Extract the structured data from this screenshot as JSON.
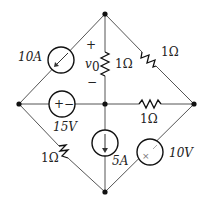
{
  "diagram": {
    "type": "circuit",
    "nodes": [
      "top",
      "left",
      "center",
      "right",
      "bottom"
    ],
    "labels": {
      "current_source_top_left": "10A",
      "v0_label": "v",
      "v0_sub": "0",
      "v0_plus": "+",
      "v0_minus": "−",
      "resistor_center_top": "1Ω",
      "resistor_top_right": "1Ω",
      "resistor_center_right": "1Ω",
      "voltage_source_left": "15V",
      "resistor_left_bottom": "1Ω",
      "current_source_center_bottom": "5A",
      "voltage_source_right_bottom": "10V",
      "vs_left_plus": "+",
      "vs_left_minus": "−"
    }
  }
}
